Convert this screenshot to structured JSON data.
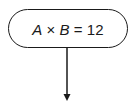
{
  "diagram": {
    "type": "flowchart",
    "nodes": [
      {
        "id": "start",
        "shape": "terminal-rounded",
        "label": "A × B = 12",
        "parts": {
          "var1": "A",
          "op1": "×",
          "var2": "B",
          "op2": "=",
          "value": "12"
        }
      }
    ],
    "edges": [
      {
        "from": "start",
        "to": "next",
        "direction": "down",
        "arrowhead": "filled"
      }
    ],
    "colors": {
      "stroke": "#1a1a1a",
      "background": "#ffffff"
    }
  }
}
